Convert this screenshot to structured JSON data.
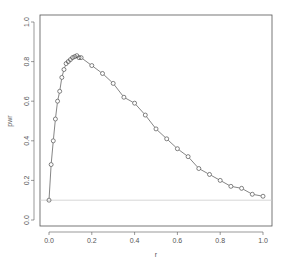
{
  "chart_data": {
    "type": "line",
    "title": "",
    "xlabel": "r",
    "ylabel": "pwr",
    "xlim": [
      0,
      1
    ],
    "ylim": [
      0,
      1
    ],
    "x_ticks": [
      "0.0",
      "0.2",
      "0.4",
      "0.6",
      "0.8",
      "1.0"
    ],
    "y_ticks": [
      "0.0",
      "0.2",
      "0.4",
      "0.6",
      "0.8",
      "1.0"
    ],
    "grid": false,
    "legend": null,
    "reference_line": {
      "orientation": "horizontal",
      "y": 0.1,
      "color": "#cccccc"
    },
    "series": [
      {
        "name": "pwr",
        "marker": "open-circle",
        "line_style": "solid",
        "color": "#333333",
        "x": [
          0,
          0.01,
          0.02,
          0.03,
          0.04,
          0.05,
          0.06,
          0.07,
          0.08,
          0.09,
          0.1,
          0.11,
          0.12,
          0.13,
          0.14,
          0.15,
          0.2,
          0.25,
          0.3,
          0.35,
          0.4,
          0.45,
          0.5,
          0.55,
          0.6,
          0.65,
          0.7,
          0.75,
          0.8,
          0.85,
          0.9,
          0.95,
          1.0
        ],
        "y": [
          0.1,
          0.28,
          0.4,
          0.51,
          0.6,
          0.65,
          0.72,
          0.76,
          0.79,
          0.8,
          0.81,
          0.82,
          0.825,
          0.83,
          0.82,
          0.82,
          0.78,
          0.74,
          0.69,
          0.62,
          0.59,
          0.53,
          0.46,
          0.41,
          0.36,
          0.32,
          0.26,
          0.23,
          0.2,
          0.17,
          0.16,
          0.13,
          0.12
        ]
      }
    ]
  }
}
